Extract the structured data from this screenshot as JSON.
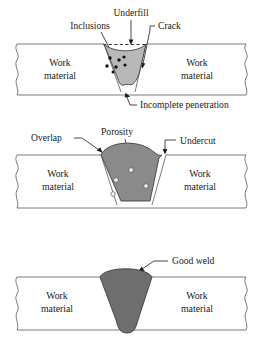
{
  "figure": {
    "colors": {
      "weld_light": "#b8b8b8",
      "weld_medium": "#8a8a8a",
      "weld_dark": "#6e6e6e",
      "plate_line": "#6b6b6b",
      "text": "#1a1a1a",
      "inclusion": "#111111",
      "pore_fill": "#f2f2f2",
      "background": "#ffffff"
    },
    "panels": [
      {
        "id": "panel-defective-weld-top",
        "weld_fill": "#b8b8b8",
        "labels": [
          {
            "id": "underfill",
            "text": "Underfill",
            "x": 131,
            "y": 16
          },
          {
            "id": "inclusions",
            "text": "Inclusions",
            "x": 90,
            "y": 29
          },
          {
            "id": "crack",
            "text": "Crack",
            "x": 167,
            "y": 29
          },
          {
            "id": "incomplete-penetration",
            "text": "Incomplete penetration",
            "x": 140,
            "y": 108
          }
        ],
        "work_material_left": {
          "line1": "Work",
          "line2": "material"
        },
        "work_material_right": {
          "line1": "Work",
          "line2": "material"
        },
        "inclusion_dots": [
          {
            "x": 110,
            "y": 58,
            "r": 1.7
          },
          {
            "x": 119,
            "y": 60,
            "r": 1.7
          },
          {
            "x": 124,
            "y": 57,
            "r": 1.6
          },
          {
            "x": 107,
            "y": 66,
            "r": 1.7
          },
          {
            "x": 116,
            "y": 67,
            "r": 1.7
          },
          {
            "x": 125,
            "y": 65,
            "r": 1.6
          },
          {
            "x": 113,
            "y": 72,
            "r": 1.5
          }
        ]
      },
      {
        "id": "panel-defective-weld-middle",
        "weld_fill": "#8a8a8a",
        "labels": [
          {
            "id": "overlap",
            "text": "Overlap",
            "x": 41,
            "y": 141
          },
          {
            "id": "porosity",
            "text": "Porosity",
            "x": 113,
            "y": 135
          },
          {
            "id": "undercut",
            "text": "Undercut",
            "x": 180,
            "y": 144
          }
        ],
        "work_material_left": {
          "line1": "Work",
          "line2": "material"
        },
        "work_material_right": {
          "line1": "Work",
          "line2": "material"
        },
        "porosity_voids": [
          {
            "x": 131,
            "y": 170,
            "r": 2.3
          },
          {
            "x": 116,
            "y": 180,
            "r": 2.3
          },
          {
            "x": 146,
            "y": 186,
            "r": 2.2
          },
          {
            "x": 113,
            "y": 194,
            "r": 2.3
          }
        ]
      },
      {
        "id": "panel-good-weld",
        "weld_fill": "#6e6e6e",
        "labels": [
          {
            "id": "good-weld",
            "text": "Good weld",
            "x": 181,
            "y": 264
          }
        ],
        "work_material_left": {
          "line1": "Work",
          "line2": "material"
        },
        "work_material_right": {
          "line1": "Work",
          "line2": "material"
        }
      }
    ]
  }
}
